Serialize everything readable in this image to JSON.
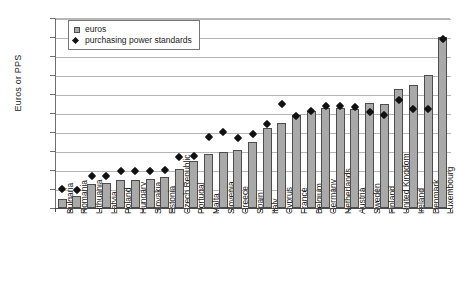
{
  "chart_data": {
    "type": "bar",
    "title": "",
    "xlabel": "",
    "ylabel": "Euros or PPS",
    "ylim": [
      0,
      20000
    ],
    "ytick_step": 2000,
    "yticks": [
      "0",
      "2000",
      "4000",
      "6000",
      "8000",
      "10000",
      "12000",
      "14000",
      "16000",
      "18000",
      "20000"
    ],
    "grid": true,
    "legend_position": "top-left",
    "categories": [
      "Bulgaria",
      "Romania",
      "Lithuania",
      "Latvia",
      "Poland",
      "Hungary",
      "Slovakia",
      "Estonia",
      "Czech Republic",
      "Portugal",
      "Malta",
      "Slovenia",
      "Greece",
      "Spain",
      "Italy",
      "Cyprus",
      "France",
      "Belgium",
      "Germany",
      "Netherlands",
      "Austria",
      "Sweden",
      "Finland",
      "United Kingdom",
      "Ireland",
      "Denmark",
      "Luxembourg"
    ],
    "series": [
      {
        "name": "euros",
        "marker": "bar",
        "color": "#a9a9a9",
        "values": [
          900,
          1300,
          2500,
          2600,
          2900,
          3000,
          3100,
          3300,
          4100,
          4900,
          5700,
          5900,
          6100,
          7000,
          8400,
          8900,
          9800,
          10200,
          10500,
          10500,
          10400,
          11100,
          11000,
          12500,
          13000,
          14000,
          18000
        ]
      },
      {
        "name": "purchasing power standards",
        "marker": "diamond",
        "color": "#111111",
        "values": [
          2000,
          1900,
          3400,
          3400,
          3900,
          3900,
          3900,
          4000,
          5400,
          5500,
          7500,
          8000,
          7400,
          7800,
          8800,
          11000,
          9700,
          10200,
          10700,
          10700,
          10600,
          10100,
          9800,
          11400,
          10400,
          10400,
          17800
        ]
      }
    ]
  },
  "legend": {
    "items": [
      {
        "label": "euros",
        "marker": "square"
      },
      {
        "label": "purchasing power standards",
        "marker": "diamond"
      }
    ]
  }
}
